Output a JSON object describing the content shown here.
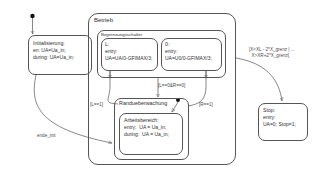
{
  "diagram": {
    "type": "statechart",
    "language": "de"
  },
  "states": {
    "initialisierung": {
      "name": "Initialisierung:",
      "lines": [
        "en: UA=Ua_in;",
        "during: UA=Ua_in;"
      ],
      "x": 28,
      "y": 35,
      "w": 64,
      "h": 40
    },
    "betrieb": {
      "name": "Betrieb",
      "x": 88,
      "y": 13,
      "w": 148,
      "h": 152
    },
    "begrenzungsschalter": {
      "name": "Begrenzungsschalter",
      "x": 97,
      "y": 30,
      "w": 129,
      "h": 48
    },
    "l_state": {
      "name": "L:",
      "lines": [
        "entry:",
        "UA=UA/0-GFIMAX/3;"
      ],
      "x": 101,
      "y": 38,
      "w": 57,
      "h": 33
    },
    "r_state": {
      "name": "0:",
      "lines": [
        "entry:",
        "UA=U0/0-GFIMAX/3;"
      ],
      "x": 161,
      "y": 38,
      "w": 61,
      "h": 33
    },
    "randueberwachung": {
      "name": "Randueberwachung",
      "x": 114,
      "y": 98,
      "w": 75,
      "h": 62
    },
    "arbeitsbereich": {
      "name": "Arbeitsbereich:",
      "lines": [
        "entry:  UA = Ua_in;",
        "during:  UA = Ua_in;"
      ],
      "x": 119,
      "y": 113,
      "w": 64,
      "h": 42
    },
    "stop": {
      "name": "Stop:",
      "lines": [
        "entry:",
        "UA=0; Stop=1;"
      ],
      "x": 258,
      "y": 103,
      "w": 50,
      "h": 38
    }
  },
  "transitions": {
    "ende_init": {
      "label": "ende_init",
      "x": 37,
      "y": 133
    },
    "l_eq_1": {
      "label": "[L==1]",
      "x": 90,
      "y": 102
    },
    "r_eq_1": {
      "label": "[R==1]",
      "x": 199,
      "y": 102
    },
    "l0_r0": {
      "label": "[L==0&R==0]",
      "x": 158,
      "y": 83
    },
    "grenz": {
      "label": "[X<XL - 2*X_grenz | ...\n  X>XR+2*X_grenz]",
      "x": 249,
      "y": 47
    }
  },
  "colors": {
    "stroke": "#555555",
    "text": "#2f2f2f",
    "label": "#4a4a4a",
    "background": "#ffffff"
  }
}
